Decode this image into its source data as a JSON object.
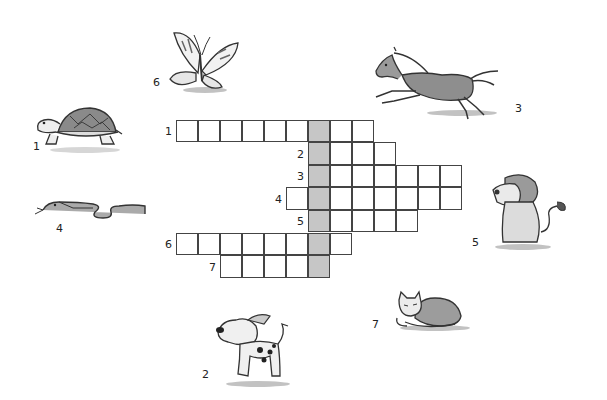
{
  "puzzle": {
    "type": "crossword",
    "grid": {
      "origin_x": 176,
      "origin_y": 120,
      "cell_w": 22,
      "cell_h": 22.6,
      "shaded_column": 6,
      "rows": [
        {
          "number": "1",
          "start_col": 0,
          "end_col": 8
        },
        {
          "number": "2",
          "start_col": 6,
          "end_col": 9
        },
        {
          "number": "3",
          "start_col": 6,
          "end_col": 12
        },
        {
          "number": "4",
          "start_col": 5,
          "end_col": 12
        },
        {
          "number": "5",
          "start_col": 6,
          "end_col": 10
        },
        {
          "number": "6",
          "start_col": 0,
          "end_col": 7
        },
        {
          "number": "7",
          "start_col": 2,
          "end_col": 6
        }
      ]
    },
    "animals": [
      {
        "number": "1",
        "name": "turtle",
        "num_x": 33,
        "num_y": 140
      },
      {
        "number": "2",
        "name": "dog",
        "num_x": 202,
        "num_y": 368
      },
      {
        "number": "3",
        "name": "horse",
        "num_x": 515,
        "num_y": 102
      },
      {
        "number": "4",
        "name": "snake",
        "num_x": 56,
        "num_y": 222
      },
      {
        "number": "5",
        "name": "lion",
        "num_x": 472,
        "num_y": 236
      },
      {
        "number": "6",
        "name": "butterfly",
        "num_x": 153,
        "num_y": 76
      },
      {
        "number": "7",
        "name": "cat",
        "num_x": 372,
        "num_y": 318
      }
    ]
  }
}
